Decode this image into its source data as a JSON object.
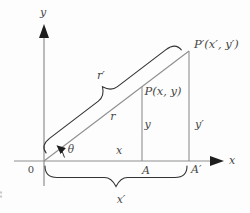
{
  "figure": {
    "colors": {
      "background": "#fdfdfd",
      "axis": "#8f8f8f",
      "brace": "#333333",
      "text": "#474747",
      "arrow": "#1e1e1e"
    },
    "axes": {
      "x_label": "x",
      "y_label": "y",
      "origin_label": "0"
    },
    "points": {
      "p_label": "P(x, y)",
      "p_prime_label": "P′(x′, y′)",
      "a_label": "A",
      "a_prime_label": "A′"
    },
    "segments": {
      "r_label": "r",
      "r_prime_label": "r′",
      "x_label": "x",
      "y_label": "y",
      "y_prime_label": "y′",
      "x_prime_label": "x′"
    },
    "angle": {
      "theta_label": "θ"
    }
  }
}
